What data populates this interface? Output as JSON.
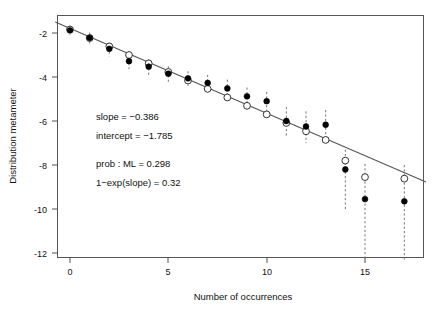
{
  "chart_data": {
    "type": "scatter",
    "title": "",
    "xlabel": "Number of occurrences",
    "ylabel": "Distribution metameter",
    "xlim": [
      -0.75,
      18.1
    ],
    "ylim": [
      -12.9,
      -1.35
    ],
    "xticks": [
      0,
      5,
      10,
      15
    ],
    "xticklabels": [
      "0",
      "5",
      "10",
      "15"
    ],
    "yticks": [
      -2,
      -4,
      -6,
      -8,
      -10,
      -12
    ],
    "yticklabels": [
      "-2",
      "-4",
      "-6",
      "-8",
      "-10",
      "-12"
    ],
    "grid": false,
    "legend": null,
    "x": [
      0,
      1,
      2,
      3,
      4,
      5,
      6,
      7,
      8,
      9,
      10,
      11,
      12,
      13,
      14,
      15,
      17
    ],
    "series": [
      {
        "name": "observed",
        "marker": "filled-circle",
        "values": [
          -1.88,
          -2.22,
          -2.72,
          -3.28,
          -3.53,
          -3.85,
          -4.06,
          -4.27,
          -4.52,
          -4.88,
          -5.1,
          -6.0,
          -6.25,
          -6.17,
          -8.2,
          -9.55,
          -9.65
        ]
      },
      {
        "name": "fitted",
        "marker": "open-circle",
        "values": [
          -1.84,
          -2.23,
          -2.61,
          -3.0,
          -3.38,
          -3.77,
          -4.16,
          -4.54,
          -4.93,
          -5.31,
          -5.7,
          -6.09,
          -6.47,
          -6.86,
          -7.8,
          -8.55,
          -8.62
        ]
      }
    ],
    "error_bars": {
      "style": "dashed-vertical",
      "lower": [
        -2.1,
        -2.52,
        -3.06,
        -3.64,
        -3.92,
        -4.22,
        -4.4,
        -4.7,
        -4.96,
        -5.32,
        -5.58,
        -6.7,
        -7.0,
        -6.95,
        -10.0,
        -12.4,
        -12.4
      ],
      "upper": [
        -1.66,
        -1.98,
        -2.44,
        -2.96,
        -3.2,
        -3.52,
        -3.74,
        -3.9,
        -4.12,
        -4.48,
        -4.68,
        -5.36,
        -5.56,
        -5.5,
        -7.3,
        -7.95,
        -8.0
      ]
    },
    "fit_line": {
      "slope": -0.386,
      "intercept": -1.785,
      "x_start": -0.75,
      "x_end": 18.1
    },
    "annotations": [
      "slope = −0.386",
      "intercept = −1.785",
      "prob : ML = 0.298",
      "1−exp(slope) = 0.32"
    ]
  },
  "figure": {
    "xlabel": "Number of occurrences",
    "ylabel": "Distribution metameter",
    "annotation_slope": "slope = −0.386",
    "annotation_intercept": "intercept = −1.785",
    "annotation_prob": "prob : ML = 0.298",
    "annotation_expslope": "1−exp(slope) = 0.32",
    "ytick_0": "-2",
    "ytick_1": "-4",
    "ytick_2": "-6",
    "ytick_3": "-8",
    "ytick_4": "-10",
    "ytick_5": "-12",
    "xtick_0": "0",
    "xtick_1": "5",
    "xtick_2": "10",
    "xtick_3": "15"
  },
  "colors": {
    "observed_marker": "#000000",
    "fitted_marker": "#ffffff",
    "fit_line": "#555555",
    "error_bar": "#777777",
    "axis": "#555555",
    "background": "#ffffff"
  }
}
